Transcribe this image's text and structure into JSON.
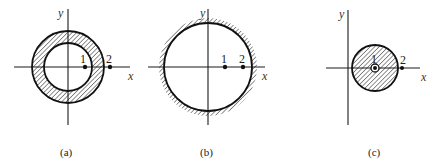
{
  "figure": {
    "panels": [
      {
        "id": "a",
        "caption": "(a)",
        "description": "Annular (ring) region shaded between inner and outer circle centered at origin",
        "x_axis_label": "x",
        "y_axis_label": "y",
        "points": [
          {
            "label": "1",
            "location": "on x-axis inside inner circle near its edge"
          },
          {
            "label": "2",
            "location": "on x-axis outside outer circle"
          }
        ]
      },
      {
        "id": "b",
        "caption": "(b)",
        "description": "Shaded region outside a single circle centered at origin (hatching on exterior)",
        "x_axis_label": "x",
        "y_axis_label": "y",
        "points": [
          {
            "label": "1",
            "location": "on x-axis inside circle"
          },
          {
            "label": "2",
            "location": "on x-axis inside circle near boundary"
          }
        ]
      },
      {
        "id": "c",
        "caption": "(c)",
        "description": "Shaded solid disk offset to the right of origin, point 1 at its center",
        "x_axis_label": "x",
        "y_axis_label": "y",
        "points": [
          {
            "label": "1",
            "location": "at center of disk"
          },
          {
            "label": "2",
            "location": "on x-axis just outside disk"
          }
        ]
      }
    ]
  }
}
